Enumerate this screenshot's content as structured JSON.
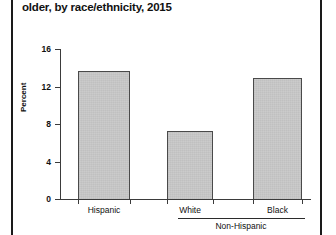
{
  "figure": {
    "title": "older, by race/ethnicity, 2015",
    "bar_fill_color": "#c9c9c9",
    "bar_border_color": "#4a4a4a",
    "axis_color": "#3b3b3b"
  },
  "chart_data": {
    "type": "bar",
    "title": "older, by race/ethnicity, 2015",
    "xlabel": "",
    "ylabel": "Percent",
    "ylim": [
      0,
      16
    ],
    "yticks": [
      0,
      4,
      8,
      12,
      16
    ],
    "ytick_labels": [
      "0",
      "4",
      "8",
      "12",
      "16"
    ],
    "grid": false,
    "legend": "none",
    "categories": [
      "Hispanic",
      "White",
      "Black"
    ],
    "values": [
      13.7,
      7.3,
      12.9
    ],
    "group_label": "Non-Hispanic",
    "grouped_categories": [
      "White",
      "Black"
    ]
  }
}
